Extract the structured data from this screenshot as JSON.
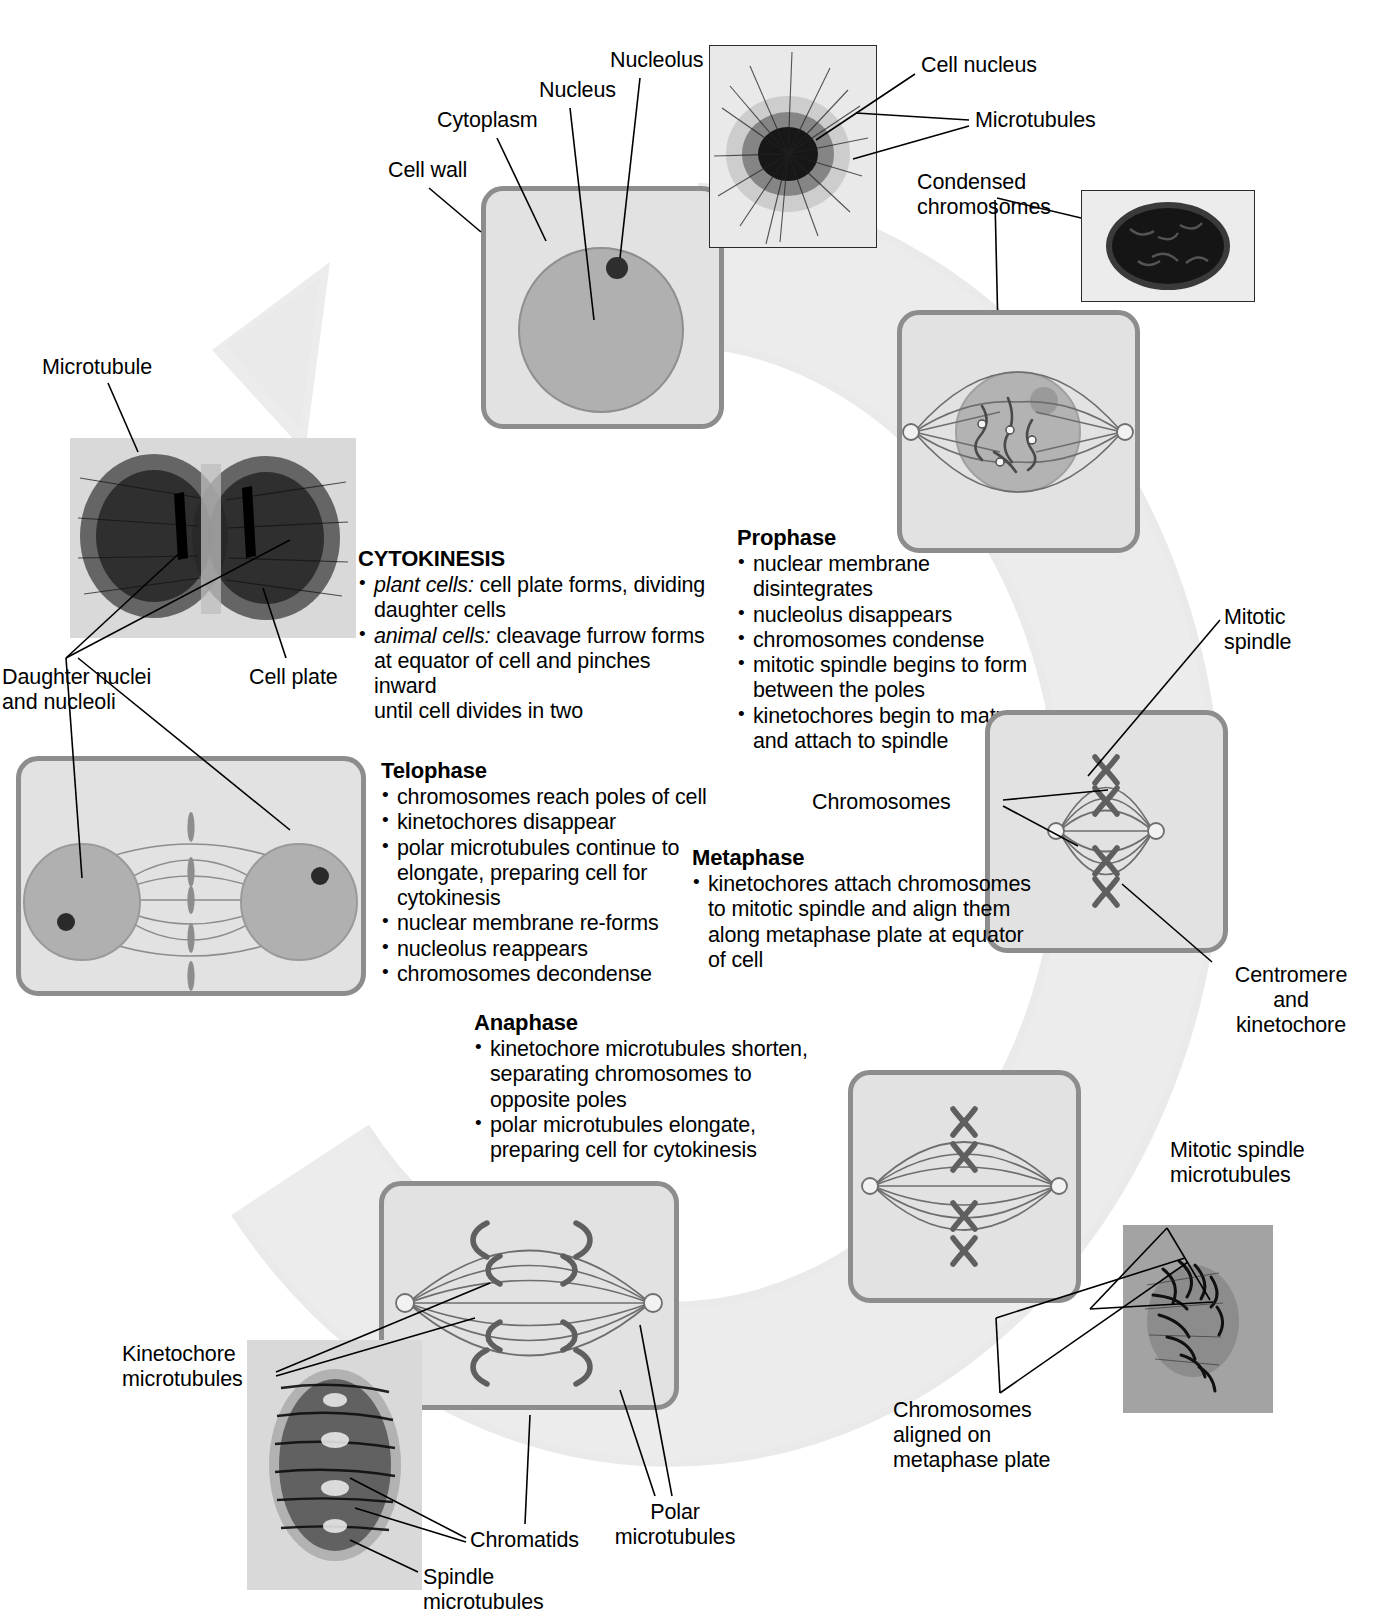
{
  "diagram": {
    "accent_cell_border": "#8d8d8d",
    "accent_cell_fill": "#e2e2e2",
    "arrow_color": "#e8e8e8"
  },
  "labels": {
    "cell_wall": "Cell wall",
    "cytoplasm": "Cytoplasm",
    "nucleus": "Nucleus",
    "nucleolus": "Nucleolus",
    "cell_nucleus": "Cell nucleus",
    "microtubules": "Microtubules",
    "condensed_chromosomes": "Condensed\nchromosomes",
    "microtubule": "Microtubule",
    "daughter_nuclei": "Daughter nuclei\nand nucleoli",
    "cell_plate": "Cell plate",
    "mitotic_spindle": "Mitotic\nspindle",
    "chromosomes": "Chromosomes",
    "centromere_kinetochore": "Centromere\nand\nkinetochore",
    "mitotic_spindle_microtubules": "Mitotic spindle\nmicrotubules",
    "chromosomes_aligned": "Chromosomes\naligned on\nmetaphase plate",
    "kinetochore_microtubules": "Kinetochore\nmicrotubules",
    "chromatids": "Chromatids",
    "polar_microtubules": "Polar\nmicrotubules",
    "spindle_microtubules": "Spindle\nmicrotubules"
  },
  "phases": {
    "prophase": {
      "heading": "Prophase",
      "bullets": [
        "nuclear membrane\ndisintegrates",
        "nucleolus disappears",
        "chromosomes condense",
        "mitotic spindle begins to form\nbetween the poles",
        "kinetochores begin to mature\nand attach to spindle"
      ]
    },
    "metaphase": {
      "heading": "Metaphase",
      "bullets": [
        "kinetochores attach chromosomes\nto mitotic spindle and align them\nalong metaphase plate at equator\nof cell"
      ]
    },
    "anaphase": {
      "heading": "Anaphase",
      "bullets": [
        "kinetochore microtubules shorten,\nseparating chromosomes to\nopposite poles",
        "polar microtubules elongate,\npreparing cell for cytokinesis"
      ]
    },
    "telophase": {
      "heading": "Telophase",
      "bullets": [
        "chromosomes reach poles of cell",
        "kinetochores disappear",
        "polar microtubules continue to\nelongate, preparing cell for\ncytokinesis",
        "nuclear membrane re-forms",
        "nucleolus reappears",
        "chromosomes decondense"
      ]
    },
    "cytokinesis": {
      "heading": "CYTOKINESIS",
      "bullets": [
        {
          "emph": "plant cells:",
          "rest": " cell plate forms, dividing\ndaughter cells"
        },
        {
          "emph": "animal cells:",
          "rest": " cleavage furrow forms\nat equator of cell and pinches inward\nuntil cell divides in two"
        }
      ]
    }
  }
}
